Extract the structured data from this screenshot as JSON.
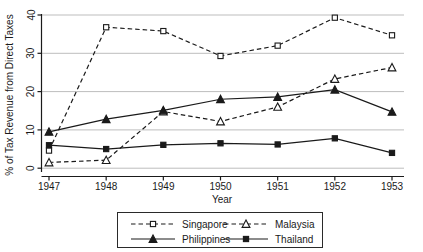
{
  "chart_data": {
    "type": "line",
    "title": "",
    "xlabel": "Year",
    "ylabel": "% of Tax Revenue from Direct Taxes",
    "categories": [
      "1947",
      "1948",
      "1949",
      "1950",
      "1951",
      "1952",
      "1953"
    ],
    "x": [
      1947,
      1948,
      1949,
      1950,
      1951,
      1952,
      1953
    ],
    "xlim": [
      1946.85,
      1953.25
    ],
    "ylim": [
      -1.5,
      41
    ],
    "yticks": [
      0,
      10,
      20,
      30,
      40
    ],
    "ytick_labels": [
      "0",
      "10",
      "20",
      "30",
      "40"
    ],
    "grid": "horizontal",
    "legend_position": "bottom-center",
    "series": [
      {
        "name": "Singapore",
        "line": "dashed",
        "marker": "open-square",
        "color": "#1a1a1a",
        "values": [
          4.6,
          36.8,
          35.8,
          29.3,
          32.0,
          39.3,
          34.7
        ]
      },
      {
        "name": "Malaysia",
        "line": "dashed",
        "marker": "open-triangle",
        "color": "#1a1a1a",
        "values": [
          1.5,
          2.1,
          14.8,
          12.2,
          16.0,
          23.3,
          26.3
        ]
      },
      {
        "name": "Philippines",
        "line": "solid",
        "marker": "filled-triangle",
        "color": "#1a1a1a",
        "values": [
          9.5,
          12.8,
          15.1,
          18.0,
          18.6,
          20.5,
          14.7
        ]
      },
      {
        "name": "Thailand",
        "line": "solid",
        "marker": "filled-square",
        "color": "#1a1a1a",
        "values": [
          6.0,
          5.0,
          6.1,
          6.5,
          6.2,
          7.8,
          4.0
        ]
      }
    ]
  },
  "legend": {
    "entries": [
      {
        "label": "Singapore"
      },
      {
        "label": "Malaysia"
      },
      {
        "label": "Philippines"
      },
      {
        "label": "Thailand"
      }
    ]
  },
  "clipped": {
    "top_text": ""
  }
}
